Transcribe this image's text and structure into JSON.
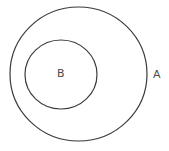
{
  "diagram": {
    "type": "venn-subset",
    "background": "#ffffff",
    "stroke_color": "#3a3a3a",
    "label_color": "#4a4a4a",
    "sets": [
      {
        "id": "A",
        "label": "A",
        "cx": 78.5,
        "cy": 74,
        "rx": 68.5,
        "ry": 67,
        "label_x": 153,
        "label_y": 78
      },
      {
        "id": "B",
        "label": "B",
        "cx": 61,
        "cy": 74.5,
        "rx": 36,
        "ry": 34.5,
        "label_x": 57,
        "label_y": 77
      }
    ],
    "relationship": "B is a subset of A"
  }
}
